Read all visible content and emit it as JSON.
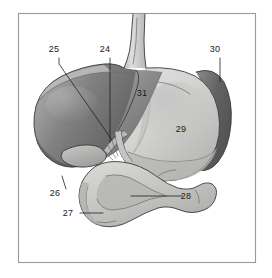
{
  "figure": {
    "background_color": "#ffffff",
    "frame_color": "#9a9a9a",
    "label_color": "#1a1a1a",
    "style": "grayscale line drawing with tonal shading"
  },
  "palette": {
    "liver_dark": "#6e6e6e",
    "liver_mid": "#858585",
    "liver_light": "#a6a6a6",
    "liver_highlight": "#b9b9b9",
    "stomach_light": "#d8d8d6",
    "stomach_mid": "#c6c6c4",
    "stomach_shadow": "#b0b0ae",
    "spleen_dark": "#5f5f5f",
    "spleen_mid": "#7d7d7d",
    "duodenum_light": "#cfcfcd",
    "duodenum_mid": "#bcbcba",
    "esophagus": "#d5d5d3",
    "gallbladder": "#b4b4b2",
    "outline": "#3a3a3a"
  },
  "labels": [
    {
      "id": "25",
      "text": "25",
      "x": 54,
      "y": 52,
      "leader": "diagonal-down-right",
      "points_to": "cystic-duct"
    },
    {
      "id": "24",
      "text": "24",
      "x": 105,
      "y": 52,
      "leader": "vertical-down",
      "points_to": "common-bile-duct"
    },
    {
      "id": "30",
      "text": "30",
      "x": 215,
      "y": 52,
      "leader": "vertical-down",
      "points_to": "spleen"
    },
    {
      "id": "31",
      "text": "31",
      "x": 142,
      "y": 96,
      "leader": "none",
      "points_to": "liver"
    },
    {
      "id": "29",
      "text": "29",
      "x": 181,
      "y": 132,
      "leader": "none",
      "points_to": "stomach"
    },
    {
      "id": "26",
      "text": "26",
      "x": 55,
      "y": 196,
      "leader": "diagonal-up-right",
      "points_to": "gallbladder"
    },
    {
      "id": "27",
      "text": "27",
      "x": 68,
      "y": 216,
      "leader": "horizontal-right",
      "points_to": "duodenum-descending"
    },
    {
      "id": "28",
      "text": "28",
      "x": 186,
      "y": 199,
      "leader": "horizontal-left",
      "points_to": "duodenum-loop"
    }
  ],
  "structures": [
    {
      "name": "esophagus",
      "label_id": null,
      "description": "vertical tube entering from top of figure"
    },
    {
      "name": "liver",
      "label_id": "31",
      "description": "large dark lobed organ on the left"
    },
    {
      "name": "stomach",
      "label_id": "29",
      "description": "large light organ right of center"
    },
    {
      "name": "spleen",
      "label_id": "30",
      "description": "dark crescent at right edge"
    },
    {
      "name": "gallbladder",
      "label_id": "26",
      "description": "small sac under the liver edge"
    },
    {
      "name": "cystic-duct",
      "label_id": "25",
      "description": "duct from gallbladder"
    },
    {
      "name": "common-bile-duct",
      "label_id": "24",
      "description": "duct at liver hilum"
    },
    {
      "name": "duodenum-descending",
      "label_id": "27",
      "description": "descending limb of duodenal loop"
    },
    {
      "name": "duodenum-loop",
      "label_id": "28",
      "description": "C-shaped duodenal loop below stomach"
    }
  ]
}
